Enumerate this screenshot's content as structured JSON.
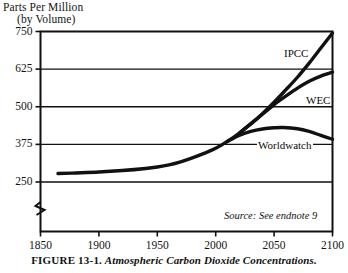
{
  "chart_data": {
    "type": "line",
    "title": "",
    "ylabel_line1": "Parts Per Million",
    "ylabel_line2": "(by Volume)",
    "xlabel": "",
    "xlim": [
      1850,
      2100
    ],
    "ylim": [
      250,
      750
    ],
    "yticks": [
      250,
      375,
      500,
      625,
      750
    ],
    "xticks": [
      1850,
      1900,
      1950,
      2000,
      2050,
      2100
    ],
    "ytick_labels": [
      "250",
      "375",
      "500",
      "625",
      "750"
    ],
    "xtick_labels": [
      "1850",
      "1900",
      "1950",
      "2000",
      "2050",
      "2100"
    ],
    "grid": true,
    "grid_axis": "y",
    "axis_break": true,
    "axis_break_note": "y-axis broken below 250",
    "legend": "inline-labels",
    "line_color": "#111111",
    "series": [
      {
        "name": "IPCC",
        "label": "IPCC",
        "x": [
          1865,
          1880,
          1900,
          1920,
          1940,
          1950,
          1960,
          1970,
          1980,
          1990,
          2000,
          2010,
          2020,
          2030,
          2040,
          2050,
          2060,
          2070,
          2080,
          2090,
          2100
        ],
        "values": [
          278,
          280,
          283,
          288,
          295,
          300,
          307,
          317,
          330,
          345,
          362,
          385,
          412,
          443,
          477,
          515,
          556,
          598,
          645,
          695,
          745
        ]
      },
      {
        "name": "WEC",
        "label": "WEC",
        "x": [
          2020,
          2030,
          2040,
          2050,
          2060,
          2070,
          2080,
          2090,
          2100
        ],
        "values": [
          412,
          443,
          475,
          507,
          535,
          562,
          585,
          602,
          615
        ]
      },
      {
        "name": "Worldwatch",
        "label": "Worldwatch",
        "x": [
          2010,
          2020,
          2030,
          2040,
          2050,
          2058,
          2070,
          2080,
          2090,
          2100
        ],
        "values": [
          385,
          405,
          418,
          426,
          430,
          431,
          427,
          418,
          405,
          392
        ]
      }
    ],
    "annotations": [
      {
        "name": "source-note",
        "text": "Source: See endnote 9"
      }
    ]
  },
  "caption": {
    "figure_number": "FIGURE 13-1.",
    "title": "Atmospheric Carbon Dioxide Concentrations."
  }
}
